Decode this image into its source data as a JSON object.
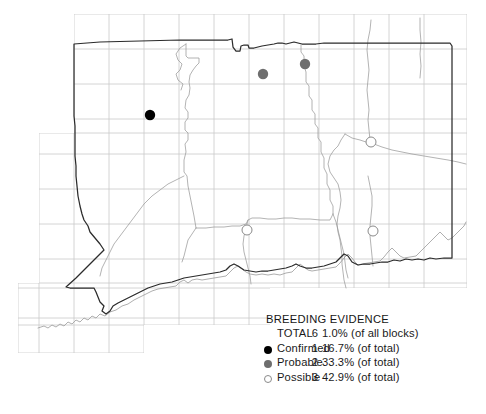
{
  "map": {
    "title": "Connecticut breeding bird atlas block map",
    "grid": {
      "color": "#c9c9c9",
      "visible": true,
      "cell_size_px": 35
    },
    "state_outline_color": "#2b2b2b",
    "county_outline_color": "#9a9a9a",
    "background": "#ffffff",
    "points": [
      {
        "evidence": "Confirmed",
        "x": 150,
        "y": 115,
        "r": 5.2,
        "fill": "#000000"
      },
      {
        "evidence": "Probable",
        "x": 263,
        "y": 74,
        "r": 5.2,
        "fill": "#6e6e6e"
      },
      {
        "evidence": "Probable",
        "x": 305,
        "y": 64,
        "r": 5.2,
        "fill": "#6e6e6e"
      },
      {
        "evidence": "Possible",
        "x": 371,
        "y": 142,
        "r": 5.2,
        "fill": "#ffffff"
      },
      {
        "evidence": "Possible",
        "x": 247,
        "y": 230,
        "r": 5.2,
        "fill": "#ffffff"
      },
      {
        "evidence": "Possible",
        "x": 373,
        "y": 231,
        "r": 5.2,
        "fill": "#ffffff"
      }
    ]
  },
  "legend": {
    "title": "BREEDING EVIDENCE",
    "rows": [
      {
        "label": "TOTAL",
        "count": "6",
        "percent": "1.0% (of all blocks)",
        "marker": "none"
      },
      {
        "label": "Confirmed",
        "count": "1",
        "percent": "16.7% (of total)",
        "marker": "filled-black-circle"
      },
      {
        "label": "Probable",
        "count": "2",
        "percent": "33.3% (of total)",
        "marker": "filled-gray-circle"
      },
      {
        "label": "Possible",
        "count": "3",
        "percent": "42.9% (of total)",
        "marker": "open-circle"
      }
    ]
  },
  "colors": {
    "confirmed": "#000000",
    "probable": "#6e6e6e",
    "possible_stroke": "#8a8a8a",
    "grid": "#c9c9c9",
    "state_border": "#2b2b2b",
    "county_border": "#9a9a9a"
  }
}
